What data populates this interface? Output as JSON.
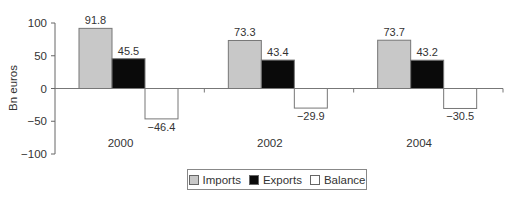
{
  "chart_data": {
    "type": "bar",
    "title": "",
    "xlabel": "",
    "ylabel": "Bn euros",
    "ylim": [
      -100,
      100
    ],
    "yticks": [
      100,
      50,
      0,
      -50,
      -100
    ],
    "ytick_labels": [
      "100",
      "50",
      "0",
      "−50",
      "−100"
    ],
    "grid": false,
    "legend_position": "bottom",
    "categories": [
      "2000",
      "2002",
      "2004"
    ],
    "series": [
      {
        "name": "Imports",
        "color": "#c8c8c8",
        "values": [
          91.8,
          73.3,
          73.7
        ],
        "labels": [
          "91.8",
          "73.3",
          "73.7"
        ]
      },
      {
        "name": "Exports",
        "color": "#0a0a0a",
        "values": [
          45.5,
          43.4,
          43.2
        ],
        "labels": [
          "45.5",
          "43.4",
          "43.2"
        ]
      },
      {
        "name": "Balance",
        "color": "#ffffff",
        "values": [
          -46.4,
          -29.9,
          -30.5
        ],
        "labels": [
          "−46.4",
          "−29.9",
          "−30.5"
        ]
      }
    ]
  },
  "legend": {
    "items": [
      {
        "label": "Imports",
        "color": "#c8c8c8"
      },
      {
        "label": "Exports",
        "color": "#0a0a0a"
      },
      {
        "label": "Balance",
        "color": "#ffffff"
      }
    ]
  }
}
